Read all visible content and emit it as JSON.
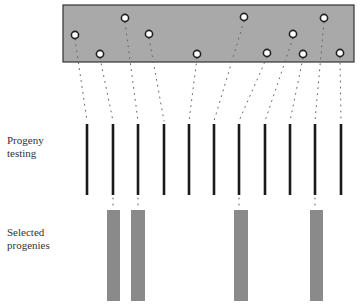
{
  "labels": {
    "progeny_testing": [
      "Progeny",
      "testing"
    ],
    "selected_progenies": [
      "Selected",
      "progenies"
    ]
  },
  "colors": {
    "population_box_fill": "#a9a9a9",
    "population_box_border": "#333333",
    "circle_fill": "#ffffff",
    "circle_stroke": "#222222",
    "dotted_line": "#666666",
    "progeny_line": "#1a1a1a",
    "selected_bar": "#8a8a8a"
  },
  "population_box": {
    "x": 63,
    "y": 5,
    "width": 291,
    "height": 57
  },
  "individuals": [
    {
      "cx": 75,
      "cy": 35,
      "line_x": 87
    },
    {
      "cx": 100,
      "cy": 54,
      "line_x": 113
    },
    {
      "cx": 125,
      "cy": 18,
      "line_x": 138
    },
    {
      "cx": 149,
      "cy": 34,
      "line_x": 164
    },
    {
      "cx": 197,
      "cy": 54,
      "line_x": 189
    },
    {
      "cx": 244,
      "cy": 17,
      "line_x": 214
    },
    {
      "cx": 267,
      "cy": 53,
      "line_x": 239
    },
    {
      "cx": 293,
      "cy": 34,
      "line_x": 265
    },
    {
      "cx": 303,
      "cy": 54,
      "line_x": 290
    },
    {
      "cx": 324,
      "cy": 18,
      "line_x": 315
    },
    {
      "cx": 340,
      "cy": 53,
      "line_x": 341
    }
  ],
  "progeny_lines": {
    "y_top": 124,
    "y_bottom": 195,
    "xs": [
      87,
      113,
      138,
      164,
      189,
      214,
      239,
      265,
      290,
      315,
      341
    ]
  },
  "selected_bars": [
    {
      "x": 107,
      "width": 13,
      "from_line_x": 113
    },
    {
      "x": 131,
      "width": 14,
      "from_line_x": 138
    },
    {
      "x": 234,
      "width": 14,
      "from_line_x": 239
    },
    {
      "x": 310,
      "width": 13,
      "from_line_x": 315
    }
  ],
  "selected_bar_span": {
    "y_top": 210,
    "y_bottom": 301
  }
}
